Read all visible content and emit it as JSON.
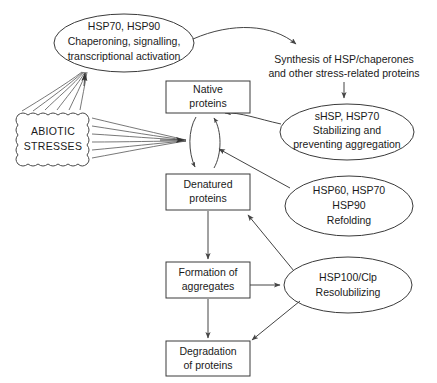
{
  "diagram": {
    "stroke_color": "#444444",
    "text_color": "#1a1a1a",
    "background_color": "#ffffff",
    "nodes": {
      "chaperoning_ellipse": {
        "shape": "ellipse",
        "line1": "HSP70,  HSP90",
        "line2": "Chaperoning, signalling,",
        "line3": "transcriptional activation"
      },
      "abiotic_stresses": {
        "shape": "cloud",
        "line1": "ABIOTIC",
        "line2": "STRESSES"
      },
      "synthesis_text": {
        "shape": "text",
        "line1": "Synthesis of HSP/chaperones",
        "line2": "and other stress-related proteins"
      },
      "shsp_ellipse": {
        "shape": "ellipse",
        "line1": "sHSP, HSP70",
        "line2": "Stabilizing and",
        "line3": "preventing aggregation"
      },
      "refolding_ellipse": {
        "shape": "ellipse",
        "line1": "HSP60, HSP70",
        "line2": "HSP90",
        "line3": "Refolding"
      },
      "resolubilizing_ellipse": {
        "shape": "ellipse",
        "line1": "HSP100/Clp",
        "line2": "Resolubilizing"
      },
      "native_proteins": {
        "shape": "rect",
        "line1": "Native",
        "line2": "proteins"
      },
      "denatured_proteins": {
        "shape": "rect",
        "line1": "Denatured",
        "line2": "proteins"
      },
      "formation_aggregates": {
        "shape": "rect",
        "line1": "Formation of",
        "line2": "aggregates"
      },
      "degradation_proteins": {
        "shape": "rect",
        "line1": "Degradation",
        "line2": "of proteins"
      }
    },
    "edges": [
      {
        "id": "stresses-to-chaperoning",
        "from": "abiotic_stresses",
        "to": "chaperoning_ellipse",
        "style": "fan-arrow"
      },
      {
        "id": "stresses-to-equilibrium",
        "from": "abiotic_stresses",
        "to": "equilibrium",
        "style": "fan-arrow"
      },
      {
        "id": "chaperoning-to-synthesis",
        "from": "chaperoning_ellipse",
        "to": "synthesis_text",
        "style": "curved-arrow"
      },
      {
        "id": "synthesis-to-shsp",
        "from": "synthesis_text",
        "to": "shsp_ellipse",
        "style": "straight-arrow"
      },
      {
        "id": "shsp-to-native",
        "from": "shsp_ellipse",
        "to": "native_proteins",
        "style": "curved-arrow"
      },
      {
        "id": "refolding-to-equilibrium",
        "from": "refolding_ellipse",
        "to": "equilibrium",
        "style": "straight-arrow"
      },
      {
        "id": "native-to-denatured",
        "from": "native_proteins",
        "to": "denatured_proteins",
        "style": "equilibrium-arrow"
      },
      {
        "id": "denatured-to-native",
        "from": "denatured_proteins",
        "to": "native_proteins",
        "style": "equilibrium-arrow"
      },
      {
        "id": "denatured-to-formation",
        "from": "denatured_proteins",
        "to": "formation_aggregates",
        "style": "straight-arrow"
      },
      {
        "id": "formation-to-resolubilizing",
        "from": "formation_aggregates",
        "to": "resolubilizing_ellipse",
        "style": "straight-arrow"
      },
      {
        "id": "resolubilizing-to-denatured",
        "from": "resolubilizing_ellipse",
        "to": "denatured_proteins",
        "style": "straight-arrow"
      },
      {
        "id": "formation-to-degradation",
        "from": "formation_aggregates",
        "to": "degradation_proteins",
        "style": "straight-arrow"
      },
      {
        "id": "resolubilizing-to-degradation",
        "from": "resolubilizing_ellipse",
        "to": "degradation_proteins",
        "style": "straight-arrow"
      }
    ]
  }
}
